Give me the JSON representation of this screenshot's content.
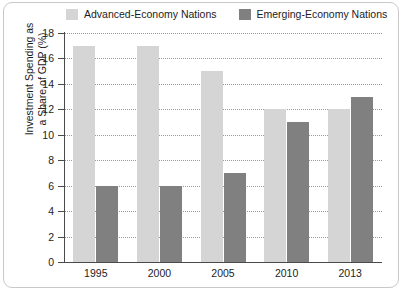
{
  "chart_data": {
    "type": "bar",
    "title": "",
    "subtitle": "",
    "xlabel": "",
    "ylabel": "Investment Spending as a Share of GDP (%)",
    "ylabel_lines": [
      "Investment Spending as",
      "a Share of GDP (%)"
    ],
    "categories": [
      "1995",
      "2000",
      "2005",
      "2010",
      "2013"
    ],
    "series": [
      {
        "name": "Advanced-Economy Nations",
        "color": "#d5d5d5",
        "values": [
          17,
          17,
          15,
          12,
          12
        ]
      },
      {
        "name": "Emerging-Economy Nations",
        "color": "#808080",
        "values": [
          6,
          6,
          7,
          11,
          13
        ]
      }
    ],
    "ylim": [
      0,
      18
    ],
    "ytick_step": 2,
    "yticks": [
      "0",
      "2",
      "4",
      "6",
      "8",
      "10",
      "12",
      "14",
      "16",
      "18"
    ],
    "grid": "horizontal-dotted",
    "legend_position": "top-center"
  },
  "legend": {
    "entries": [
      {
        "label": "Advanced-Economy Nations",
        "swatch": "light-gray-swatch-icon"
      },
      {
        "label": "Emerging-Economy Nations",
        "swatch": "dark-gray-swatch-icon"
      }
    ]
  },
  "colors": {
    "advanced": "#d5d5d5",
    "emerging": "#808080",
    "axis": "#4a4a4a",
    "grid": "#9a9a9a",
    "frame": "#c9c9c9",
    "text": "#1d1d1d"
  }
}
